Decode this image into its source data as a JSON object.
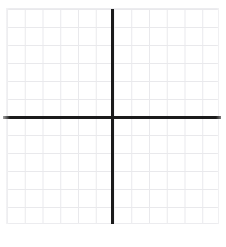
{
  "figure": {
    "type": "cartesian-grid",
    "background_color": "#ffffff"
  },
  "grid": {
    "line_color": "#e9e9ec",
    "border_color": "#ececef",
    "cell_size_px": 18,
    "columns": 12,
    "rows": 12,
    "label": "grid paper"
  },
  "axes": {
    "color": "#1b1b1b",
    "thickness_px": 3,
    "x_axis_label": "",
    "y_axis_label": "",
    "origin_x_px": 112,
    "origin_y_px": 117,
    "tick_labels_x": [],
    "tick_labels_y": []
  },
  "watermark": {
    "text": ""
  },
  "chart_data": {
    "type": "scatter",
    "title": "",
    "subtitle": "",
    "xlabel": "",
    "ylabel": "",
    "x": [],
    "y": [],
    "series": [],
    "categories": [],
    "values": [],
    "annotations": [],
    "legend": [],
    "legend_position": "none",
    "grid": true,
    "xlim": [
      -6,
      6
    ],
    "ylim": [
      -6,
      6
    ],
    "xticks": [
      -6,
      -5,
      -4,
      -3,
      -2,
      -1,
      0,
      1,
      2,
      3,
      4,
      5,
      6
    ],
    "yticks": [
      -6,
      -5,
      -4,
      -3,
      -2,
      -1,
      0,
      1,
      2,
      3,
      4,
      5,
      6
    ],
    "xtick_labels": [],
    "ytick_labels": [],
    "note": "Empty coordinate plane: grid paper with bold x and y axes and no plotted data, ticks, or labels."
  }
}
